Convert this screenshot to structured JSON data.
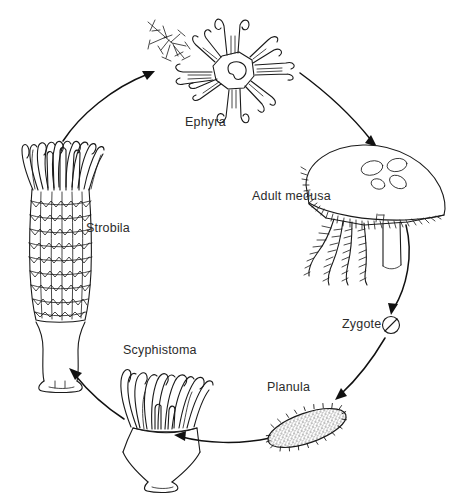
{
  "diagram": {
    "type": "cycle-diagram",
    "background_color": "#ffffff",
    "ink_color": "#1a1a1a",
    "label_color": "#2b2b2b",
    "width": 460,
    "height": 499,
    "stages": [
      {
        "id": "ephyra",
        "label": "Ephyra",
        "icon": "ephyra-icon",
        "description": "eight-armed star-shaped juvenile medusa with bifurcated arm tips and central gastric cavity",
        "position": "top-center"
      },
      {
        "id": "adult-medusa",
        "label": "Adult medusa",
        "icon": "adult-medusa-icon",
        "description": "domed bell with four gonads, marginal tentacle fringe and frilled oral arms",
        "position": "right-upper"
      },
      {
        "id": "zygote",
        "label": "Zygote",
        "icon": "zygote-icon",
        "description": "small circular cell with a diagonal cleavage line",
        "position": "right-lower"
      },
      {
        "id": "planula",
        "label": "Planula",
        "icon": "planula-icon",
        "description": "elongated ciliated stippled larva tilted to the right",
        "position": "bottom-right"
      },
      {
        "id": "scyphistoma",
        "label": "Scyphistoma",
        "icon": "scyphistoma-icon",
        "description": "sessile polyp with long wavy tentacles, calyx, stalk and basal disc",
        "position": "bottom-center"
      },
      {
        "id": "strobila",
        "label": "Strobila",
        "icon": "strobila-icon",
        "description": "segmented stack of developing ephyrae on a stalk with tentacles at the top",
        "position": "left"
      }
    ],
    "arrows": [
      {
        "id": "arrow-strobila-to-ephyra",
        "from": "strobila",
        "to": "ephyra",
        "icon": "curved-arrow-icon"
      },
      {
        "id": "arrow-ephyra-to-medusa",
        "from": "ephyra",
        "to": "adult-medusa",
        "icon": "curved-arrow-icon"
      },
      {
        "id": "arrow-medusa-to-zygote",
        "from": "adult-medusa",
        "to": "zygote",
        "icon": "curved-arrow-icon"
      },
      {
        "id": "arrow-zygote-to-planula",
        "from": "zygote",
        "to": "planula",
        "icon": "curved-arrow-icon"
      },
      {
        "id": "arrow-planula-to-scyphistoma",
        "from": "planula",
        "to": "scyphistoma",
        "icon": "curved-arrow-icon"
      },
      {
        "id": "arrow-scyphistoma-to-strobila",
        "from": "scyphistoma",
        "to": "strobila",
        "icon": "curved-arrow-icon"
      }
    ]
  }
}
